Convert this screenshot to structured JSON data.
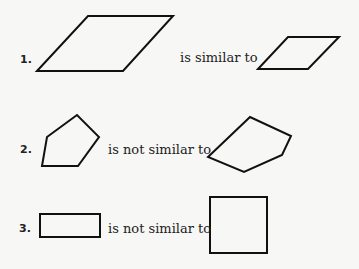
{
  "items": [
    {
      "number": "1.",
      "relation": "is similar to"
    },
    {
      "number": "2.",
      "relation": "is not similar to"
    },
    {
      "number": "3.",
      "relation": "is not similar to"
    }
  ],
  "colors": {
    "background": "#f7f7f5",
    "ink": "#111111"
  }
}
